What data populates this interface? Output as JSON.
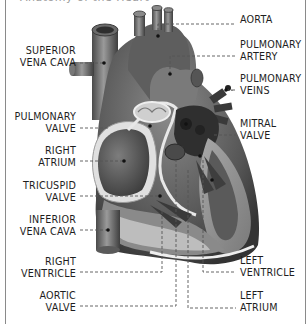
{
  "diagram": {
    "title_partial": "Anatomy of the Heart",
    "labels_left": [
      {
        "id": "superior-vena-cava",
        "lines": [
          "SUPERIOR",
          "VENA CAVA"
        ]
      },
      {
        "id": "pulmonary-valve",
        "lines": [
          "PULMONARY",
          "VALVE"
        ]
      },
      {
        "id": "right-atrium",
        "lines": [
          "RIGHT",
          "ATRIUM"
        ]
      },
      {
        "id": "tricuspid-valve",
        "lines": [
          "TRICUSPID",
          "VALVE"
        ]
      },
      {
        "id": "inferior-vena-cava",
        "lines": [
          "INFERIOR",
          "VENA CAVA"
        ]
      },
      {
        "id": "right-ventricle",
        "lines": [
          "RIGHT",
          "VENTRICLE"
        ]
      },
      {
        "id": "aortic-valve",
        "lines": [
          "AORTIC",
          "VALVE"
        ]
      }
    ],
    "labels_right": [
      {
        "id": "aorta",
        "lines": [
          "AORTA"
        ]
      },
      {
        "id": "pulmonary-artery",
        "lines": [
          "PULMONARY",
          "ARTERY"
        ]
      },
      {
        "id": "pulmonary-veins",
        "lines": [
          "PULMONARY",
          "VEINS"
        ]
      },
      {
        "id": "mitral-valve",
        "lines": [
          "MITRAL",
          "VALVE"
        ]
      },
      {
        "id": "left-ventricle",
        "lines": [
          "LEFT",
          "VENTRICLE"
        ]
      },
      {
        "id": "left-atrium",
        "lines": [
          "LEFT",
          "ATRIUM"
        ]
      }
    ],
    "colors": {
      "background": "#ffffff",
      "frame": "#8a8a8a",
      "label_text": "#1e1e1e",
      "leader_line": "#555555",
      "tissue_dark": "#3c3c3c",
      "tissue_mid": "#6e6e6e",
      "tissue_light": "#b4b4b4",
      "highlight": "#e6e6e6"
    }
  }
}
